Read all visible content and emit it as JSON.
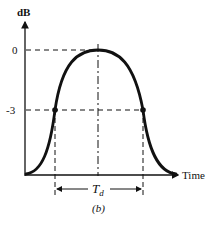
{
  "diagram": {
    "y_axis_label": "dB",
    "x_axis_label": "Time",
    "y_ticks": [
      {
        "label": "0",
        "level_db": 0
      },
      {
        "label": "-3",
        "level_db": -3
      }
    ],
    "duration_label_main": "T",
    "duration_label_sub": "d",
    "caption": "(b)",
    "curve": "bell-shaped pulse envelope (dB vs time), peak at 0 dB, crossing -3 dB at two points marked with dots",
    "colors": {
      "line": "#111111",
      "background": "#ffffff"
    }
  }
}
